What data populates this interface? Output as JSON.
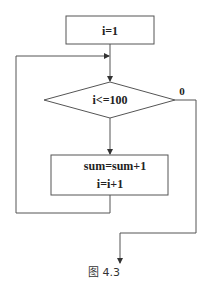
{
  "figure": {
    "caption": "图 4.3",
    "nodes": {
      "init": {
        "type": "process",
        "text": "i=1"
      },
      "condition": {
        "type": "decision",
        "text": "i<=100"
      },
      "body": {
        "type": "process",
        "lines": [
          "sum=sum+1",
          "i=i+1"
        ]
      }
    },
    "edges": {
      "false_label": "0"
    },
    "colors": {
      "stroke": "#555555",
      "background": "#ffffff",
      "text": "#222222"
    }
  }
}
